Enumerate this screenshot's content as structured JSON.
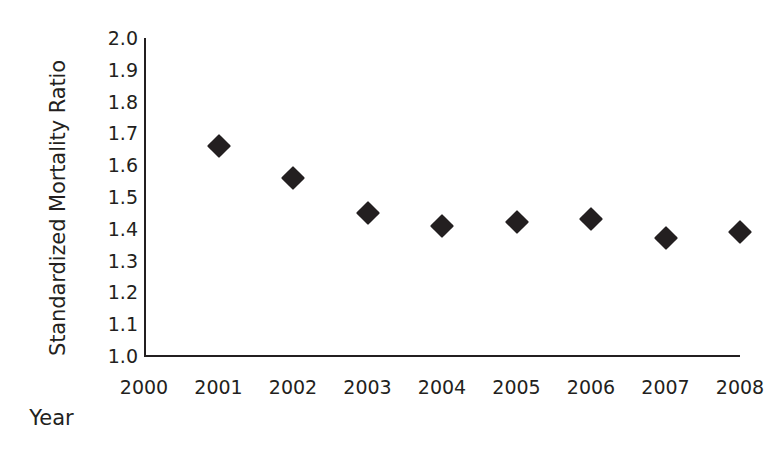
{
  "chart_data": {
    "type": "scatter",
    "title": "",
    "xlabel": "Year",
    "ylabel": "Standardized Mortality Ratio",
    "x": [
      2001,
      2002,
      2003,
      2004,
      2005,
      2006,
      2007,
      2008
    ],
    "values": [
      1.66,
      1.56,
      1.45,
      1.41,
      1.42,
      1.43,
      1.37,
      1.39
    ],
    "categories": [
      "2001",
      "2002",
      "2003",
      "2004",
      "2005",
      "2006",
      "2007",
      "2008"
    ],
    "xlim": [
      2000,
      2008
    ],
    "ylim": [
      1.0,
      2.0
    ],
    "xticks": [
      "2000",
      "2001",
      "2002",
      "2003",
      "2004",
      "2005",
      "2006",
      "2007",
      "2008"
    ],
    "yticks": [
      "2.0",
      "1.9",
      "1.8",
      "1.7",
      "1.6",
      "1.5",
      "1.4",
      "1.3",
      "1.2",
      "1.1",
      "1.0"
    ],
    "grid": false,
    "legend": null,
    "marker": "diamond",
    "marker_color": "#231f20",
    "axis_color": "#231f20",
    "background": "#ffffff"
  }
}
